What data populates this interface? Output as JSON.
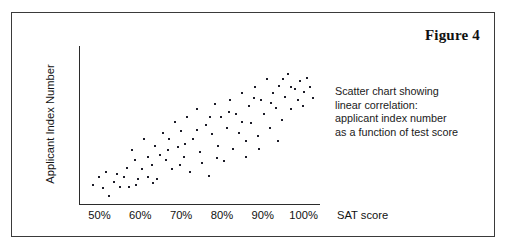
{
  "figure": {
    "number_label": "Figure 4",
    "caption_lines": [
      "Scatter chart showing",
      "linear correlation:",
      "applicant index number",
      "as a function of test score"
    ],
    "border_color": "#3a3a3a"
  },
  "chart_data": {
    "type": "scatter",
    "title": "",
    "xlabel": "SAT score",
    "ylabel": "Applicant Index Number",
    "xtick_labels": [
      "50%",
      "60%",
      "70%",
      "80%",
      "90%",
      "100%"
    ],
    "xtick_values": [
      50,
      60,
      70,
      80,
      90,
      100
    ],
    "ytick_labels": [],
    "xlim": [
      45,
      104
    ],
    "ylim": [
      0,
      100
    ],
    "grid": false,
    "legend": null,
    "marker_color": "#1c1c28",
    "points": [
      [
        48.5,
        12
      ],
      [
        50.0,
        17
      ],
      [
        50.8,
        10
      ],
      [
        51.5,
        20
      ],
      [
        52.3,
        5
      ],
      [
        53.5,
        14
      ],
      [
        55.0,
        11
      ],
      [
        56.0,
        17
      ],
      [
        57.2,
        11
      ],
      [
        58.0,
        34
      ],
      [
        58.8,
        28
      ],
      [
        59.5,
        16
      ],
      [
        60.3,
        22
      ],
      [
        61.0,
        41
      ],
      [
        62.0,
        17
      ],
      [
        62.8,
        25
      ],
      [
        63.5,
        37
      ],
      [
        64.2,
        16
      ],
      [
        64.8,
        31
      ],
      [
        65.5,
        45
      ],
      [
        66.2,
        28
      ],
      [
        67.0,
        41
      ],
      [
        67.8,
        22
      ],
      [
        68.5,
        52
      ],
      [
        69.2,
        36
      ],
      [
        70.0,
        46
      ],
      [
        70.8,
        30
      ],
      [
        71.5,
        55
      ],
      [
        72.2,
        20
      ],
      [
        73.0,
        41
      ],
      [
        73.8,
        60
      ],
      [
        74.5,
        33
      ],
      [
        75.2,
        26
      ],
      [
        76.0,
        50
      ],
      [
        76.8,
        18
      ],
      [
        77.5,
        44
      ],
      [
        78.2,
        63
      ],
      [
        79.0,
        37
      ],
      [
        79.8,
        55
      ],
      [
        80.5,
        27
      ],
      [
        81.2,
        48
      ],
      [
        82.0,
        66
      ],
      [
        82.8,
        35
      ],
      [
        83.5,
        57
      ],
      [
        84.2,
        45
      ],
      [
        85.0,
        70
      ],
      [
        85.8,
        30
      ],
      [
        86.5,
        62
      ],
      [
        87.2,
        51
      ],
      [
        88.0,
        74
      ],
      [
        88.8,
        43
      ],
      [
        89.5,
        66
      ],
      [
        90.2,
        57
      ],
      [
        91.0,
        79
      ],
      [
        91.8,
        48
      ],
      [
        92.5,
        70
      ],
      [
        93.2,
        61
      ],
      [
        94.0,
        75
      ],
      [
        94.8,
        53
      ],
      [
        95.5,
        68
      ],
      [
        96.2,
        82
      ],
      [
        97.0,
        60
      ],
      [
        97.8,
        73
      ],
      [
        98.5,
        66
      ],
      [
        99.2,
        78
      ],
      [
        100.0,
        71
      ],
      [
        100.8,
        80
      ],
      [
        101.5,
        74
      ],
      [
        102.2,
        67
      ],
      [
        99.8,
        62
      ],
      [
        86.0,
        40
      ],
      [
        78.8,
        29
      ],
      [
        71.0,
        38
      ],
      [
        63.0,
        13
      ],
      [
        56.8,
        23
      ],
      [
        93.8,
        40
      ],
      [
        89.0,
        35
      ],
      [
        81.8,
        58
      ],
      [
        74.0,
        47
      ],
      [
        66.8,
        34
      ],
      [
        96.8,
        74
      ],
      [
        92.0,
        64
      ],
      [
        84.8,
        52
      ],
      [
        77.0,
        55
      ],
      [
        69.8,
        25
      ],
      [
        59.0,
        12
      ],
      [
        61.8,
        30
      ],
      [
        54.2,
        19
      ],
      [
        87.8,
        67
      ],
      [
        95.0,
        79
      ]
    ]
  }
}
